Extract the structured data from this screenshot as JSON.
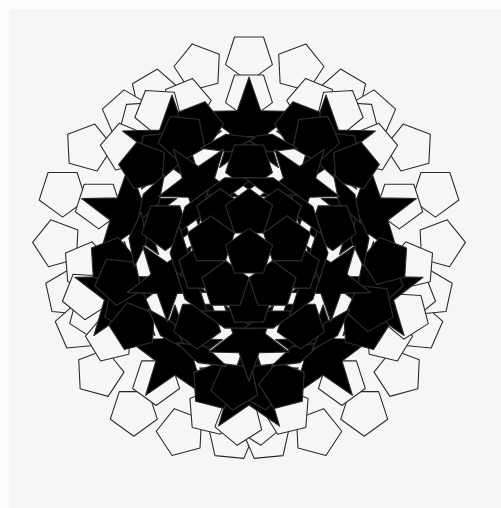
{
  "artwork": {
    "title": "Penrose P1 pentagonal tiling",
    "medium": "hand-coloured paper tiling photograph",
    "symmetry": "five-fold (D5) rotational symmetry",
    "background_color": "#f7f6f4",
    "paper_margin_color": "#fdfdfc",
    "outline_color": "#2b2b2b",
    "outline_width": 1.1,
    "center": {
      "x": 249,
      "y": 253
    },
    "bounds": {
      "left": 36,
      "top": 29,
      "right": 478,
      "bottom": 470
    },
    "palette": {
      "white": "#fbfbfa",
      "light_gray": "#d8d6d1",
      "medium_gray": "#7c7b77",
      "dark_gray": "#3b3a38",
      "outline": "#2b2b2b"
    },
    "legend": [
      {
        "name": "white-pentagon",
        "color": "#fbfbfa",
        "label": "White pentagon (outer ring)"
      },
      {
        "name": "light-rhomb",
        "color": "#d8d6d1",
        "label": "Light rhomb / light pentagon"
      },
      {
        "name": "medium-pentagon",
        "color": "#7c7b77",
        "label": "Medium gray pentagon"
      },
      {
        "name": "dark-star",
        "color": "#3b3a38",
        "label": "Dark five-pointed star / boat"
      }
    ]
  },
  "chart_data": {
    "type": "diagram",
    "tile_types": [
      "pentagon",
      "rhomb",
      "five-pointed-star",
      "boat"
    ],
    "fold_symmetry": 5,
    "rings": [
      {
        "ring": 0,
        "description": "central medium-gray pentagon (point up)",
        "count": 1,
        "color": "#7c7b77"
      },
      {
        "ring": 1,
        "description": "five light-gray pentagons around the center",
        "count": 5,
        "color": "#d8d6d1"
      },
      {
        "ring": 2,
        "description": "five medium-gray pentagons alternating with dark stars",
        "count": 5,
        "color": "#7c7b77"
      },
      {
        "ring": 3,
        "description": "light rhombs ringing the core",
        "count": 10,
        "color": "#d8d6d1"
      },
      {
        "ring": 4,
        "description": "dark five-pointed stars",
        "count": 10,
        "color": "#3b3a38"
      },
      {
        "ring": 5,
        "description": "medium-gray pentagons of the outer annulus",
        "count": 15,
        "color": "#7c7b77"
      },
      {
        "ring": 6,
        "description": "white pentagon border ring",
        "count": 25,
        "color": "#fbfbfa"
      }
    ]
  },
  "geometry": {
    "unit": 29.6,
    "comment": "All polygon coordinates are generated by the template script from the five-fold construction; values below drive it.",
    "core_pentagon_radius": 25,
    "ring1_pentagon_radius": 25,
    "ring1_distance": 47,
    "ring2_distance": 93,
    "ring3_distance": 133,
    "ring4_distance": 160,
    "ring5_distance": 186,
    "outer_ring_distance": 205
  }
}
